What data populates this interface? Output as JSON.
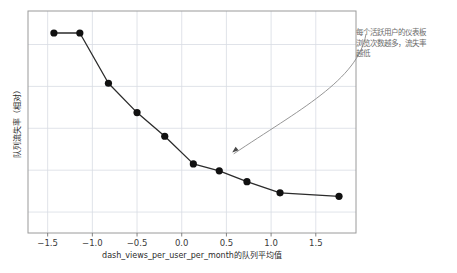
{
  "chart_data": {
    "type": "line",
    "title": "",
    "xlabel": "dash_views_per_user_per_month的队列平均值",
    "ylabel": "队列流失率（相对）",
    "xlim": [
      -1.72,
      1.95
    ],
    "ylim": [
      0.0,
      1.06
    ],
    "grid": true,
    "legend": "none",
    "marker": "filled-circle",
    "line_color": "#2b2b2b",
    "marker_color": "#111111",
    "grid_color": "#d8dce3",
    "frame_color": "#999999",
    "annotation_color": "#7a7a7a",
    "xticks": [
      "-1.5",
      "-1.0",
      "-0.5",
      "0.0",
      "0.5",
      "1.0",
      "1.5"
    ],
    "xtick_values": [
      -1.5,
      -1.0,
      -0.5,
      0.0,
      0.5,
      1.0,
      1.5
    ],
    "yticks": [],
    "x": [
      -1.43,
      -1.14,
      -0.82,
      -0.5,
      -0.19,
      0.13,
      0.42,
      0.73,
      1.1,
      1.76
    ],
    "values": [
      0.955,
      0.955,
      0.715,
      0.575,
      0.462,
      0.33,
      0.297,
      0.245,
      0.192,
      0.175
    ],
    "points": [
      {
        "x": -1.43,
        "y": 0.955
      },
      {
        "x": -1.14,
        "y": 0.955
      },
      {
        "x": -0.82,
        "y": 0.715
      },
      {
        "x": -0.5,
        "y": 0.575
      },
      {
        "x": -0.19,
        "y": 0.462
      },
      {
        "x": 0.13,
        "y": 0.33
      },
      {
        "x": 0.42,
        "y": 0.297
      },
      {
        "x": 0.73,
        "y": 0.245
      },
      {
        "x": 1.1,
        "y": 0.192
      },
      {
        "x": 1.76,
        "y": 0.175
      }
    ],
    "annotations": [
      {
        "name": "churn-insight-note",
        "lines": [
          "每个活跃用户的仪表板",
          "浏览次数越多，流失率",
          "越低"
        ],
        "text": "每个活跃用户的仪表板浏览次数越多，流失率越低",
        "arrow_target": {
          "x": 0.565,
          "y": 0.385
        }
      }
    ]
  },
  "axis": {
    "x_title": "dash_views_per_user_per_month的队列平均值",
    "y_title": "队列流失率（相对）"
  }
}
